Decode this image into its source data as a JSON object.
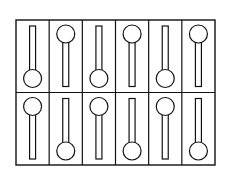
{
  "diagram": {
    "type": "switch-grid",
    "rows": 2,
    "cols": 6,
    "stroke": "#111111",
    "background": "#ffffff",
    "grid": {
      "left": 16,
      "top": 20,
      "right": 215,
      "bottom": 165
    },
    "cells": [
      [
        "bottom",
        "top",
        "bottom",
        "top",
        "bottom",
        "top"
      ],
      [
        "top",
        "bottom",
        "top",
        "bottom",
        "top",
        "bottom"
      ]
    ]
  }
}
